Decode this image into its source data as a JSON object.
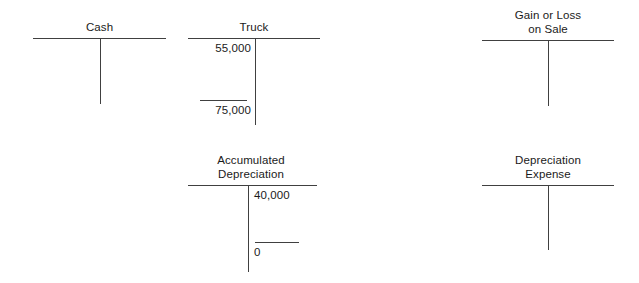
{
  "diagram": {
    "kind": "t-account-ledger",
    "line_color": "#404040",
    "text_color": "#1a1a1a",
    "background": "#ffffff"
  },
  "accounts": [
    {
      "id": "cash",
      "title": "Cash",
      "debit_entries": [],
      "credit_entries": [],
      "has_total_rule": false
    },
    {
      "id": "truck",
      "title": "Truck",
      "debit_entries": [
        "55,000"
      ],
      "credit_entries": [],
      "total_side": "debit",
      "total": "75,000",
      "has_total_rule": true
    },
    {
      "id": "gain-or-loss-on-sale",
      "title": "Gain or Loss\non Sale",
      "debit_entries": [],
      "credit_entries": [],
      "has_total_rule": false
    },
    {
      "id": "accumulated-depreciation",
      "title": "Accumulated\nDepreciation",
      "debit_entries": [],
      "credit_entries": [
        "40,000"
      ],
      "total_side": "credit",
      "total": "0",
      "has_total_rule": true
    },
    {
      "id": "depreciation-expense",
      "title": "Depreciation\nExpense",
      "debit_entries": [],
      "credit_entries": [],
      "has_total_rule": false
    }
  ],
  "labels": {
    "cash_title": "Cash",
    "truck_title": "Truck",
    "truck_debit_1": "55,000",
    "truck_total": "75,000",
    "gain_loss_title": "Gain or Loss\non Sale",
    "accum_dep_title": "Accumulated\nDepreciation",
    "accum_dep_credit_1": "40,000",
    "accum_dep_total": "0",
    "dep_expense_title": "Depreciation\nExpense"
  }
}
